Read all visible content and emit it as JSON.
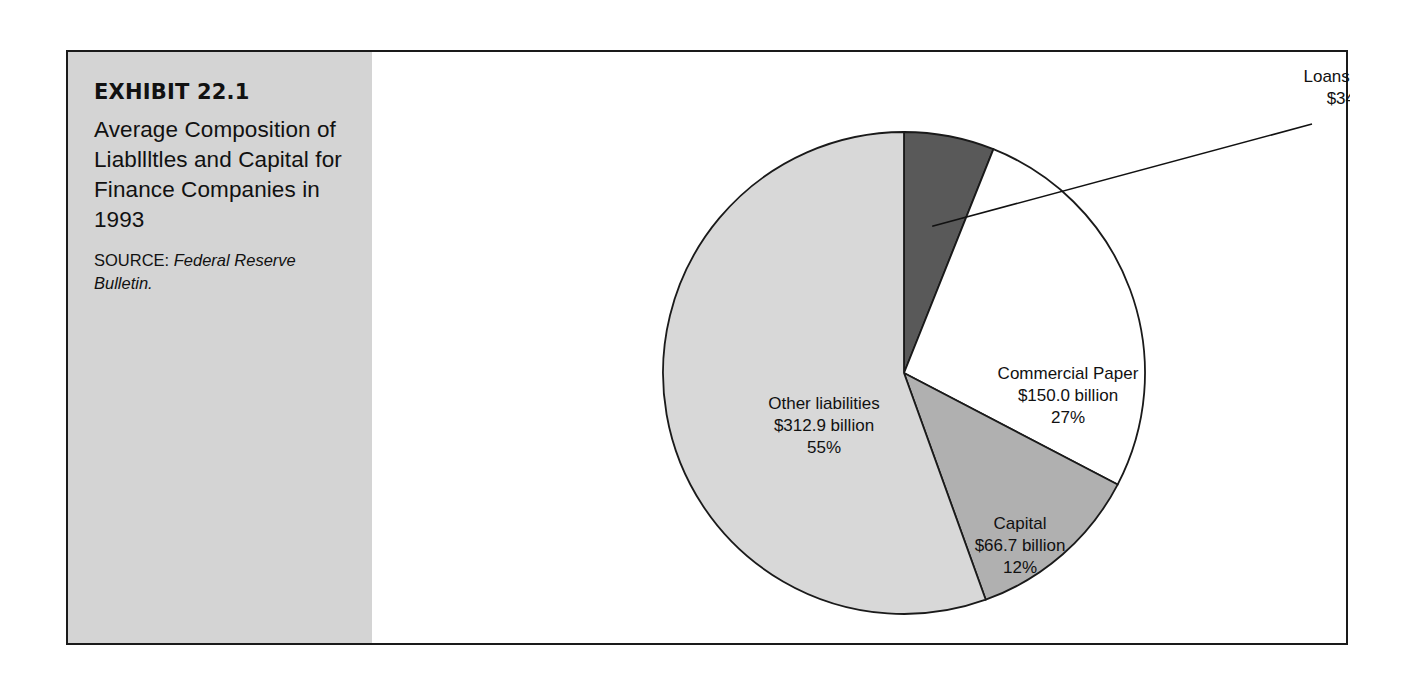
{
  "exhibit": {
    "number": "EXHIBIT 22.1",
    "title": "Average Composition of Liabllltles and Capital for Finance Companies in 1993",
    "source_label": "SOURCE: ",
    "source_publication": "Federal Reserve Bulletin."
  },
  "chart_data": {
    "type": "pie",
    "title": "Average Composition of Liabllltles and Capital for Finance Companies in 1993",
    "unit": "billion USD",
    "legend": "none",
    "total_label": "",
    "start_angle_deg": 0,
    "direction": "clockwise",
    "categories": [
      "Loans from Banks",
      "Commercial Paper",
      "Capital",
      "Other liabilities"
    ],
    "values": [
      34.1,
      150.0,
      66.7,
      312.9
    ],
    "percents": [
      6,
      27,
      12,
      55
    ],
    "colors": [
      "#595959",
      "#ffffff",
      "#b0b0b0",
      "#d8d8d8"
    ],
    "slices": [
      {
        "name": "Loans from Banks",
        "value": 34.1,
        "percent": 6,
        "color": "#595959",
        "label_lines": [
          "Loans from Banks",
          "$34.1 billion",
          "6%"
        ],
        "label_x": 1000,
        "label_y": 30,
        "label_placement": "outside-with-leader"
      },
      {
        "name": "Commercial Paper",
        "value": 150.0,
        "percent": 27,
        "color": "#ffffff",
        "label_lines": [
          "Commercial Paper",
          "$150.0 billion",
          "27%"
        ],
        "label_x": 696,
        "label_y": 327,
        "label_placement": "inside"
      },
      {
        "name": "Capital",
        "value": 66.7,
        "percent": 12,
        "color": "#b0b0b0",
        "label_lines": [
          "Capital",
          "$66.7 billion",
          "12%"
        ],
        "label_x": 648,
        "label_y": 477,
        "label_placement": "inside"
      },
      {
        "name": "Other liabilities",
        "value": 312.9,
        "percent": 55,
        "color": "#d8d8d8",
        "label_lines": [
          "Other liabilities",
          "$312.9 billion",
          "55%"
        ],
        "label_x": 452,
        "label_y": 357,
        "label_placement": "inside"
      }
    ],
    "geometry": {
      "center_x": 532,
      "center_y": 321,
      "radius": 241
    },
    "outline_color": "#1a1a1a",
    "background": "#ffffff"
  },
  "style": {
    "frame_border_color": "#1a1a1a",
    "panel_background": "#d4d4d4",
    "text_color": "#111111"
  }
}
